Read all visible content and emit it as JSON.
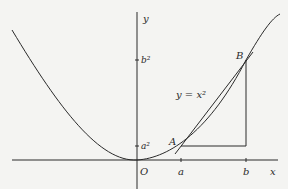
{
  "diagram": {
    "curve_label": "y = x²",
    "axes": {
      "x_label": "x",
      "y_label": "y",
      "origin_label": "O"
    },
    "x_ticks": [
      {
        "label": "a",
        "x": 181
      },
      {
        "label": "b",
        "x": 246
      }
    ],
    "y_ticks": [
      {
        "label": "a²",
        "y": 146
      },
      {
        "label": "b²",
        "y": 60
      }
    ],
    "points": [
      {
        "label": "A",
        "x": 181,
        "y": 146
      },
      {
        "label": "B",
        "x": 246,
        "y": 60
      }
    ],
    "colors": {
      "background": "#f4f4f2",
      "ink": "#2a2a2a"
    }
  }
}
